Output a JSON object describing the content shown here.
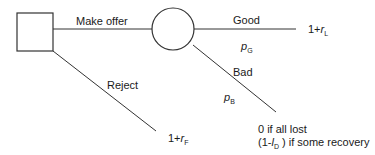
{
  "diagram": {
    "type": "decision-tree",
    "nodes": {
      "decision": {
        "shape": "square"
      },
      "chance": {
        "shape": "circle"
      }
    },
    "branches": {
      "make_offer": "Make offer",
      "reject": "Reject",
      "good": "Good",
      "bad": "Bad"
    },
    "probabilities": {
      "good": {
        "sym": "p",
        "sub": "G"
      },
      "bad": {
        "sym": "p",
        "sub": "B"
      }
    },
    "payoffs": {
      "good": {
        "prefix": "1+",
        "sym": "r",
        "sub": "L"
      },
      "reject": {
        "prefix": "1+",
        "sym": "r",
        "sub": "F"
      },
      "bad_line1": "0 if all lost",
      "bad_line2_prefix": "(1-",
      "bad_line2_sym": "l",
      "bad_line2_sub": "D",
      "bad_line2_suffix": " ) if some recovery"
    },
    "colors": {
      "line": "#333333",
      "text": "#1a1a1a"
    }
  }
}
